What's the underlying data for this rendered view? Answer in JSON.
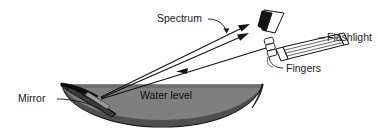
{
  "figure": {
    "title_present": false,
    "background_color": "#ffffff",
    "ink_color": "#111111",
    "water_fill_color": "#808080",
    "mirror_fill_color": "#1a1a1a",
    "bowl_shadow_color": "#4a4a4a"
  },
  "labels": {
    "spectrum": "Spectrum",
    "flashlight": "Flashlight",
    "fingers": "Fingers",
    "mirror": "Mirror",
    "water_level": "Water level"
  },
  "diagram_elements": [
    {
      "id": "bowl",
      "name": "bowl-of-water",
      "description": "Shallow crescent-shaped bowl seen from the side, filled with gray water"
    },
    {
      "id": "mirror",
      "name": "mirror",
      "description": "Flat dark mirror leaning at an angle inside the bowl, partly submerged"
    },
    {
      "id": "flashlight",
      "name": "flashlight",
      "description": "Cylindrical flashlight tilted down-left, held toward the submerged mirror"
    },
    {
      "id": "fingers",
      "name": "fingers",
      "description": "Three small finger segments gripping the barrel of the flashlight"
    },
    {
      "id": "card",
      "name": "spectrum-card",
      "description": "Bent white card held above, catching the reflected spectrum"
    },
    {
      "id": "incident-ray",
      "name": "incident-light-ray",
      "description": "Single ray travelling from the flashlight down-left to the mirror"
    },
    {
      "id": "reflected-rays",
      "name": "reflected-spectrum-rays",
      "description": "Two rays reflected from the mirror up-right onto the card, forming the spectrum"
    }
  ]
}
